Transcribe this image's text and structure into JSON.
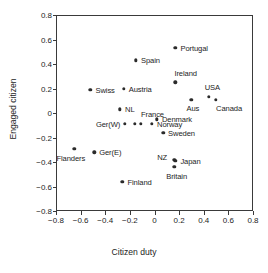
{
  "chart_data": {
    "type": "scatter",
    "title": "",
    "xlabel": "Citizen duty",
    "ylabel": "Engaged citizen",
    "xlim": [
      -0.8,
      0.8
    ],
    "ylim": [
      -0.8,
      0.8
    ],
    "xticks": [
      "-0.8",
      "-0.6",
      "-0.4",
      "-0.2",
      "0",
      "0.2",
      "0.4",
      "0.6",
      "0.8"
    ],
    "xtick_values": [
      -0.8,
      -0.6,
      -0.4,
      -0.2,
      0,
      0.2,
      0.4,
      0.6,
      0.8
    ],
    "yticks": [
      "0.8",
      "0.6",
      "0.4",
      "0.2",
      "0",
      "-0.2",
      "-0.4",
      "-0.6",
      "-0.8"
    ],
    "ytick_values": [
      0.8,
      0.6,
      0.4,
      0.2,
      0,
      -0.2,
      -0.4,
      -0.6,
      -0.8
    ],
    "grid": false,
    "legend": "none",
    "marker_color": "#2b2b2b",
    "axis_color": "#3a3a3a",
    "points": [
      {
        "label": "Portugal",
        "x": 0.17,
        "y": 0.53,
        "label_dx": 5,
        "label_dy": -3
      },
      {
        "label": "Spain",
        "x": -0.15,
        "y": 0.43,
        "label_dx": 5,
        "label_dy": -3
      },
      {
        "label": "Ireland",
        "x": 0.17,
        "y": 0.25,
        "label_dx": -1,
        "label_dy": -12
      },
      {
        "label": "Swiss",
        "x": -0.52,
        "y": 0.19,
        "label_dx": 5,
        "label_dy": -3
      },
      {
        "label": "Austria",
        "x": -0.25,
        "y": 0.2,
        "label_dx": 5,
        "label_dy": -3
      },
      {
        "label": "USA",
        "x": 0.44,
        "y": 0.13,
        "label_dx": -4,
        "label_dy": -13
      },
      {
        "label": "Aus",
        "x": 0.3,
        "y": 0.11,
        "label_dx": -5,
        "label_dy": 5
      },
      {
        "label": "Canada",
        "x": 0.5,
        "y": 0.11,
        "label_dx": 0,
        "label_dy": 5
      },
      {
        "label": "NL",
        "x": -0.28,
        "y": 0.03,
        "label_dx": 5,
        "label_dy": -3
      },
      {
        "label": "France",
        "x": -0.11,
        "y": -0.09,
        "label_dx": 0,
        "label_dy": -13
      },
      {
        "label": "Denmark",
        "x": 0.02,
        "y": -0.05,
        "label_dx": 5,
        "label_dy": -3
      },
      {
        "label": "Ger(W)",
        "x": -0.24,
        "y": -0.09,
        "label_dx": -29,
        "label_dy": -3
      },
      {
        "label": "",
        "x": -0.16,
        "y": -0.09,
        "label_dx": 0,
        "label_dy": 0
      },
      {
        "label": "Norway",
        "x": -0.02,
        "y": -0.09,
        "label_dx": 5,
        "label_dy": -3
      },
      {
        "label": "Sweden",
        "x": 0.07,
        "y": -0.16,
        "label_dx": 5,
        "label_dy": -3
      },
      {
        "label": "Flanders",
        "x": -0.65,
        "y": -0.29,
        "label_dx": -18,
        "label_dy": 6
      },
      {
        "label": "Ger(E)",
        "x": -0.49,
        "y": -0.32,
        "label_dx": 5,
        "label_dy": -3
      },
      {
        "label": "NZ",
        "x": 0.16,
        "y": -0.38,
        "label_dx": -17,
        "label_dy": -6
      },
      {
        "label": "Japan",
        "x": 0.17,
        "y": -0.39,
        "label_dx": 5,
        "label_dy": -3
      },
      {
        "label": "Britain",
        "x": 0.16,
        "y": -0.44,
        "label_dx": -8,
        "label_dy": 6
      },
      {
        "label": "Finland",
        "x": -0.26,
        "y": -0.56,
        "label_dx": 5,
        "label_dy": -3
      }
    ]
  }
}
